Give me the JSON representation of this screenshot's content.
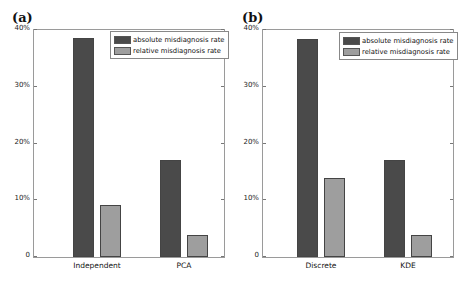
{
  "chart_data": [
    {
      "type": "bar",
      "panel_label": "(a)",
      "categories": [
        "Independent",
        "PCA"
      ],
      "series": [
        {
          "name": "absolute misdiagnosis rate",
          "color": "#4a4a4a",
          "values": [
            38.6,
            17.1
          ]
        },
        {
          "name": "relative misdiagnosis rate",
          "color": "#9e9e9e",
          "values": [
            9.2,
            3.9
          ]
        }
      ],
      "yticks": [
        "0",
        "10%",
        "20%",
        "30%",
        "40%"
      ],
      "ylim": [
        0,
        40
      ],
      "xlabel": "",
      "ylabel": "",
      "legend_position": "upper right",
      "grid": false
    },
    {
      "type": "bar",
      "panel_label": "(b)",
      "categories": [
        "Discrete",
        "KDE"
      ],
      "series": [
        {
          "name": "absolute misdiagnosis rate",
          "color": "#4a4a4a",
          "values": [
            38.4,
            17.1
          ]
        },
        {
          "name": "relative misdiagnosis rate",
          "color": "#9e9e9e",
          "values": [
            13.9,
            3.9
          ]
        }
      ],
      "yticks": [
        "0",
        "10%",
        "20%",
        "30%",
        "40%"
      ],
      "ylim": [
        0,
        40
      ],
      "xlabel": "",
      "ylabel": "",
      "legend_position": "upper right",
      "grid": false
    }
  ]
}
